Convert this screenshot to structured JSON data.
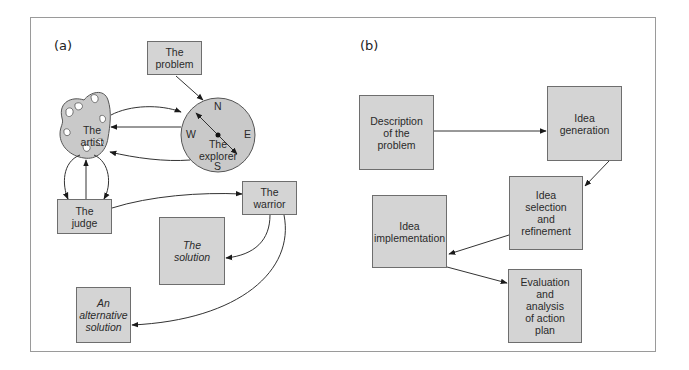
{
  "panels": {
    "a": {
      "label": "(a)",
      "nodes": {
        "problem": "The\nproblem",
        "artist": "The\nartist",
        "explorer": "The\nexplorer",
        "judge": "The\njudge",
        "warrior": "The\nwarrior",
        "solution": "The\nsolution",
        "alternative": "An\nalternative\nsolution"
      },
      "compass": {
        "n": "N",
        "e": "E",
        "s": "S",
        "w": "W"
      }
    },
    "b": {
      "label": "(b)",
      "nodes": {
        "description": "Description\nof the\nproblem",
        "generation": "Idea\ngeneration",
        "selection": "Idea\nselection\nand\nrefinement",
        "implementation": "Idea\nimplementation",
        "evaluation": "Evaluation\nand\nanalysis\nof action\nplan"
      }
    }
  },
  "colors": {
    "box_fill": "#d4d4d4",
    "stroke": "#222222",
    "frame": "#9a9a9a"
  }
}
